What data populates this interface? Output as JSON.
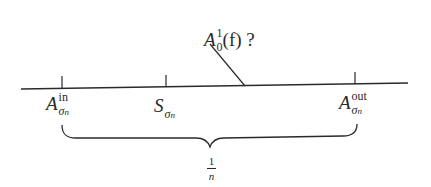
{
  "diagram": {
    "colors": {
      "ink": "#2a2a2a",
      "background": "#ffffff"
    },
    "axis": {
      "x_start": 21,
      "y_start": 89,
      "x_end": 408,
      "y_end": 83
    },
    "ticks": [
      {
        "x": 62,
        "label_base": "A",
        "label_sup": "in",
        "label_sub": "σ",
        "label_sub_sub": "n"
      },
      {
        "x": 166,
        "label_base": "S",
        "label_sup": "",
        "label_sub": "σ",
        "label_sub_sub": "n"
      },
      {
        "x": 355,
        "label_base": "A",
        "label_sup": "out",
        "label_sub": "σ",
        "label_sub_sub": "n"
      }
    ],
    "pointer": {
      "label_base": "A",
      "label_sup": "1",
      "label_sub": "0",
      "label_arg": "(f)",
      "label_question": "?",
      "from": [
        210,
        44
      ],
      "to": [
        245,
        86
      ]
    },
    "brace": {
      "from_x": 62,
      "to_x": 357,
      "label_numerator": "1",
      "label_denominator": "n"
    }
  }
}
